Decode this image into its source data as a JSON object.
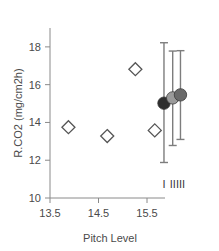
{
  "chart_data": {
    "type": "scatter",
    "title": "",
    "xlabel": "Pitch Level",
    "ylabel": "R.CO2 (mg/cm2h)",
    "xlim": [
      13.2,
      16.3
    ],
    "ylim": [
      10,
      19
    ],
    "grid": false,
    "legend": "none",
    "xticks": [
      13.5,
      14.5,
      15.5
    ],
    "xtick_labels": [
      "13.5",
      "14.5",
      "15.5"
    ],
    "yticks": [
      10,
      12,
      14,
      16,
      18
    ],
    "ytick_labels": [
      "10",
      "12",
      "14",
      "16",
      "18"
    ],
    "series": [
      {
        "name": "Observations",
        "marker": "open-diamond",
        "color": "#ffffff",
        "edge_color": "#555555",
        "points": [
          {
            "x": 13.88,
            "y": 13.75
          },
          {
            "x": 14.68,
            "y": 13.28
          },
          {
            "x": 15.26,
            "y": 16.82
          },
          {
            "x": 15.66,
            "y": 13.58
          }
        ]
      },
      {
        "name": "Group means with error bars",
        "marker": "filled-circle",
        "points": [
          {
            "label": "I",
            "x": 15.85,
            "y": 15.02,
            "y_low": 11.88,
            "y_high": 18.22,
            "color": "#2e2e2e"
          },
          {
            "label": "II",
            "x": 16.03,
            "y": 15.3,
            "y_low": 12.78,
            "y_high": 17.78,
            "color": "#9a9a9a"
          },
          {
            "label": "III",
            "x": 16.19,
            "y": 15.46,
            "y_low": 13.1,
            "y_high": 17.8,
            "color": "#6a6a6a"
          }
        ]
      }
    ],
    "group_labels": [
      "I",
      "II",
      "III"
    ],
    "axis_color": "#808080"
  }
}
